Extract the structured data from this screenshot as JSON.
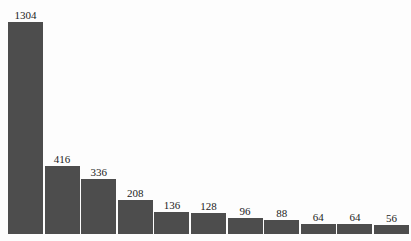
{
  "chart_data": {
    "type": "bar",
    "title": "",
    "subtitle": "",
    "xlabel": "",
    "ylabel": "",
    "categories": [
      "1",
      "2",
      "3",
      "4",
      "5",
      "6",
      "7",
      "8",
      "9",
      "10",
      "11"
    ],
    "values": [
      1304,
      416,
      336,
      208,
      136,
      128,
      96,
      88,
      64,
      64,
      56
    ],
    "data_labels": [
      "1304",
      "416",
      "336",
      "208",
      "136",
      "128",
      "96",
      "88",
      "64",
      "64",
      "56"
    ],
    "ylim": [
      0,
      1304
    ],
    "grid": false,
    "legend": null,
    "legend_position": "none",
    "axes_visible": false,
    "tick_labels_x": [],
    "tick_labels_y": [],
    "annotations": [],
    "series": [
      {
        "name": "counts",
        "values": [
          1304,
          416,
          336,
          208,
          136,
          128,
          96,
          88,
          64,
          64,
          56
        ]
      }
    ]
  },
  "style": {
    "bar_color": "#4d4d4d",
    "background_color": "#fdfdfd",
    "label_color": "#1c1c1c"
  }
}
